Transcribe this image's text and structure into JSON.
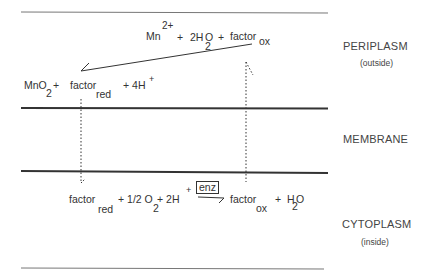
{
  "regions": {
    "periplasm": {
      "label": "PERIPLASM",
      "sublabel": "(outside)"
    },
    "membrane": {
      "label": "MEMBRANE"
    },
    "cytoplasm": {
      "label": "CYTOPLASM",
      "sublabel": "(inside)"
    }
  },
  "periplasm_reaction": {
    "reactants": {
      "mn": "Mn",
      "mn_charge": "2+",
      "plus1": "+",
      "water": "2H",
      "water_sub": "2",
      "water_o": "O",
      "plus2": "+",
      "factor": "factor",
      "factor_sub": "ox"
    },
    "products": {
      "mno": "MnO",
      "mno_sub": "2",
      "plus1": "+",
      "factor": "factor",
      "factor_sub": "red",
      "protons": "+ 4H",
      "protons_charge": "+"
    }
  },
  "cytoplasm_reaction": {
    "reactants": {
      "factor": "factor",
      "factor_sub": "red",
      "oxygen": "+ 1/2 O",
      "oxygen_sub": "2",
      "protons": "+  2H",
      "protons_charge": "+"
    },
    "enzyme": "enz",
    "products": {
      "factor": "factor",
      "factor_sub": "ox",
      "plus": "+",
      "water_h": "H",
      "water_sub": "2",
      "water_o": "O"
    }
  },
  "colors": {
    "line": "#555555",
    "membrane_line": "#333333",
    "text": "#333333"
  }
}
